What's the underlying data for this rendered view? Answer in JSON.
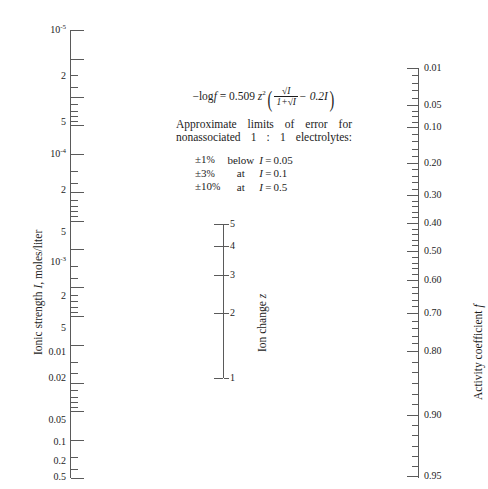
{
  "figure": {
    "type": "nomogram",
    "cut_caption": "",
    "background": "#ffffff",
    "ink_color": "#1c1c1c"
  },
  "left_scale": {
    "name": "ionic-strength-scale",
    "title": "Ionic strength I, moles/liter",
    "title_plain": "Ionic strength",
    "title_var": "I",
    "title_units": ", moles/liter",
    "labels": [
      {
        "text": "10",
        "exp": "-5",
        "y": 30
      },
      {
        "text": "2",
        "exp": "",
        "y": 76
      },
      {
        "text": "5",
        "exp": "",
        "y": 122
      },
      {
        "text": "10",
        "exp": "-4",
        "y": 154
      },
      {
        "text": "2",
        "exp": "",
        "y": 190
      },
      {
        "text": "5",
        "exp": "",
        "y": 232
      },
      {
        "text": "10",
        "exp": "-3",
        "y": 262
      },
      {
        "text": "2",
        "exp": "",
        "y": 296
      },
      {
        "text": "5",
        "exp": "",
        "y": 328
      },
      {
        "text": "0.01",
        "exp": "",
        "y": 352
      },
      {
        "text": "0.02",
        "exp": "",
        "y": 378
      },
      {
        "text": "0.05",
        "exp": "",
        "y": 420
      },
      {
        "text": "0.1",
        "exp": "",
        "y": 442
      },
      {
        "text": "0.2",
        "exp": "",
        "y": 461
      },
      {
        "text": "0.5",
        "exp": "",
        "y": 477
      }
    ]
  },
  "center_scale": {
    "name": "ion-charge-scale",
    "title": "Ion change z",
    "title_plain": "Ion change",
    "title_var": "z",
    "labels": [
      {
        "text": "5",
        "y": 224
      },
      {
        "text": "4",
        "y": 246
      },
      {
        "text": "3",
        "y": 275
      },
      {
        "text": "2",
        "y": 313
      },
      {
        "text": "1",
        "y": 378
      }
    ]
  },
  "right_scale": {
    "name": "activity-coefficient-scale",
    "title": "Activity coefficient f",
    "title_plain": "Activity coefficient",
    "title_var": "f",
    "labels": [
      {
        "text": "0.01",
        "y": 68
      },
      {
        "text": "0.05",
        "y": 105
      },
      {
        "text": "0.10",
        "y": 127
      },
      {
        "text": "0.20",
        "y": 163
      },
      {
        "text": "0.30",
        "y": 195
      },
      {
        "text": "0.40",
        "y": 223
      },
      {
        "text": "0.50",
        "y": 251
      },
      {
        "text": "0.60",
        "y": 280
      },
      {
        "text": "0.70",
        "y": 313
      },
      {
        "text": "0.80",
        "y": 351
      },
      {
        "text": "0.90",
        "y": 415
      },
      {
        "text": "0.95",
        "y": 476
      }
    ]
  },
  "formula": {
    "name": "debye-huckel-formula",
    "lhs": "−log",
    "lhs_var": "f",
    "eq": "=",
    "coefficient": "0.509",
    "charge_var": "z",
    "charge_exp": "2",
    "numerator": "√I",
    "denominator": "1+√I",
    "minus_term": "− 0.2I",
    "plain": "−log f = 0.509 z²(√I/(1+√I) − 0.2I)"
  },
  "notes": {
    "name": "error-limits-note",
    "line1": "Approximate limits of error for",
    "line2": "nonassociated 1 : 1 electrolytes:",
    "rows": [
      {
        "tol": "±1%",
        "rel": "below",
        "cond": "I = 0.05"
      },
      {
        "tol": "±3%",
        "rel": "at",
        "cond": "I = 0.1"
      },
      {
        "tol": "±10%",
        "rel": "at",
        "cond": "I = 0.5"
      }
    ]
  },
  "chart_data": {
    "type": "nomogram",
    "axes": [
      {
        "name": "Ionic strength I, moles/liter",
        "orientation": "vertical-left",
        "scale": "logarithmic-inverted",
        "ticks": [
          "10^-5",
          "2",
          "5",
          "10^-4",
          "2",
          "5",
          "10^-3",
          "2",
          "5",
          "0.01",
          "0.02",
          "0.05",
          "0.1",
          "0.2",
          "0.5"
        ],
        "range": [
          "1e-5",
          "0.5"
        ]
      },
      {
        "name": "Ion change z",
        "orientation": "vertical-center",
        "scale": "nonlinear",
        "ticks": [
          "5",
          "4",
          "3",
          "2",
          "1"
        ],
        "range": [
          "1",
          "5"
        ]
      },
      {
        "name": "Activity coefficient f",
        "orientation": "vertical-right",
        "scale": "nonlinear",
        "ticks": [
          "0.01",
          "0.05",
          "0.10",
          "0.20",
          "0.30",
          "0.40",
          "0.50",
          "0.60",
          "0.70",
          "0.80",
          "0.90",
          "0.95"
        ],
        "range": [
          "0.01",
          "0.95"
        ]
      }
    ],
    "equation": "−log f = 0.509 z²(√I/(1+√I) − 0.2I)",
    "annotations": [
      "Approximate limits of error for nonassociated 1 : 1 electrolytes:",
      "±1% below I = 0.05",
      "±3% at I = 0.1",
      "±10% at I = 0.5"
    ],
    "grid": false,
    "legend": "none"
  }
}
